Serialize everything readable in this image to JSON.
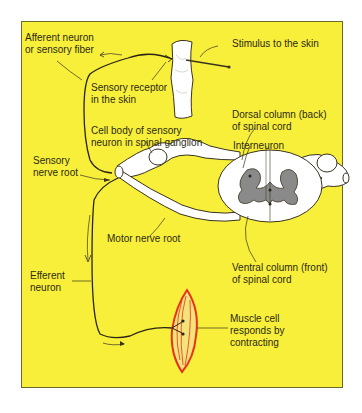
{
  "diagram": {
    "colors": {
      "background": "#f7ef3a",
      "border": "#6a6a2a",
      "nerve": "#ffffff",
      "grey_matter": "#8a8a8a",
      "muscle": "#e8321e",
      "line": "#3a3320",
      "text": "#2e2a18"
    },
    "labels": {
      "afferent_1": "Afferent neuron",
      "afferent_2": "or sensory fiber",
      "stimulus": "Stimulus to the skin",
      "receptor_1": "Sensory receptor",
      "receptor_2": "in the skin",
      "cell_body_1": "Cell body of sensory",
      "cell_body_2": "neuron in spinal ganglion",
      "dorsal_1": "Dorsal column (back)",
      "dorsal_2": "of spinal cord",
      "interneuron": "Interneuron",
      "sensory_root_1": "Sensory",
      "sensory_root_2": "nerve root",
      "motor_root": "Motor nerve root",
      "ventral_1": "Ventral column (front)",
      "ventral_2": "of spinal cord",
      "efferent_1": "Efferent",
      "efferent_2": "neuron",
      "muscle_1": "Muscle cell",
      "muscle_2": "responds by",
      "muscle_3": "contracting"
    }
  }
}
